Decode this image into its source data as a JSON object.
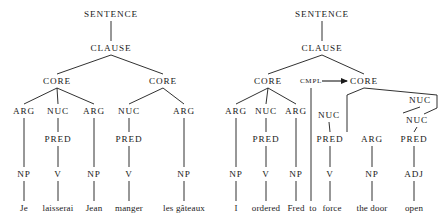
{
  "figure": {
    "type": "syntax-tree-pair"
  },
  "trees": [
    {
      "id": "left",
      "sentence": "Je laisserai Jean manger les gâteaux",
      "nodes": [
        {
          "id": "L-SENTENCE",
          "label": "SENTENCE",
          "x": 111,
          "y": 14,
          "cls": "lvl-sentence"
        },
        {
          "id": "L-CLAUSE",
          "label": "CLAUSE",
          "x": 111,
          "y": 48,
          "cls": "lvl-clause"
        },
        {
          "id": "L-CORE1",
          "label": "CORE",
          "x": 57,
          "y": 81,
          "cls": "lvl-core"
        },
        {
          "id": "L-CORE2",
          "label": "CORE",
          "x": 163,
          "y": 81,
          "cls": "lvl-core"
        },
        {
          "id": "L-ARG1",
          "label": "ARG",
          "x": 24,
          "y": 111,
          "cls": "lvl-arg"
        },
        {
          "id": "L-NUC1",
          "label": "NUC",
          "x": 58,
          "y": 111,
          "cls": "lvl-arg"
        },
        {
          "id": "L-ARG2",
          "label": "ARG",
          "x": 94,
          "y": 111,
          "cls": "lvl-arg"
        },
        {
          "id": "L-NUC2",
          "label": "NUC",
          "x": 129,
          "y": 111,
          "cls": "lvl-arg"
        },
        {
          "id": "L-ARG3",
          "label": "ARG",
          "x": 184,
          "y": 111,
          "cls": "lvl-arg"
        },
        {
          "id": "L-PRED1",
          "label": "PRED",
          "x": 58,
          "y": 139,
          "cls": "lvl-pred"
        },
        {
          "id": "L-PRED2",
          "label": "PRED",
          "x": 129,
          "y": 139,
          "cls": "lvl-pred"
        },
        {
          "id": "L-NP1",
          "label": "NP",
          "x": 24,
          "y": 174,
          "cls": "lvl-cat"
        },
        {
          "id": "L-V1",
          "label": "V",
          "x": 58,
          "y": 174,
          "cls": "lvl-cat"
        },
        {
          "id": "L-NP2",
          "label": "NP",
          "x": 94,
          "y": 174,
          "cls": "lvl-cat"
        },
        {
          "id": "L-V2",
          "label": "V",
          "x": 129,
          "y": 174,
          "cls": "lvl-cat"
        },
        {
          "id": "L-NP3",
          "label": "NP",
          "x": 184,
          "y": 174,
          "cls": "lvl-cat"
        }
      ],
      "words": [
        {
          "id": "L-W1",
          "text": "Je",
          "x": 24,
          "y": 208
        },
        {
          "id": "L-W2",
          "text": "laisserai",
          "x": 58,
          "y": 208
        },
        {
          "id": "L-W3",
          "text": "Jean",
          "x": 94,
          "y": 208
        },
        {
          "id": "L-W4",
          "text": "manger",
          "x": 129,
          "y": 208
        },
        {
          "id": "L-W5",
          "text": "les gâteaux",
          "x": 184,
          "y": 208
        }
      ],
      "edges": [
        [
          111,
          21,
          111,
          41
        ],
        [
          111,
          55,
          57,
          74
        ],
        [
          111,
          55,
          163,
          74
        ],
        [
          57,
          88,
          24,
          104
        ],
        [
          57,
          88,
          58,
          104
        ],
        [
          57,
          88,
          94,
          104
        ],
        [
          163,
          88,
          129,
          104
        ],
        [
          163,
          88,
          184,
          104
        ],
        [
          24,
          118,
          24,
          167
        ],
        [
          58,
          118,
          58,
          132
        ],
        [
          58,
          146,
          58,
          167
        ],
        [
          94,
          118,
          94,
          167
        ],
        [
          129,
          118,
          129,
          132
        ],
        [
          129,
          146,
          129,
          167
        ],
        [
          184,
          118,
          184,
          167
        ],
        [
          24,
          181,
          24,
          201
        ],
        [
          58,
          181,
          58,
          201
        ],
        [
          94,
          181,
          94,
          201
        ],
        [
          129,
          181,
          129,
          201
        ],
        [
          184,
          181,
          184,
          201
        ]
      ]
    },
    {
      "id": "right",
      "sentence": "I ordered Fred to force the door open",
      "nodes": [
        {
          "id": "R-SENTENCE",
          "label": "SENTENCE",
          "x": 322,
          "y": 14,
          "cls": "lvl-sentence"
        },
        {
          "id": "R-CLAUSE",
          "label": "CLAUSE",
          "x": 322,
          "y": 48,
          "cls": "lvl-clause"
        },
        {
          "id": "R-CORE1",
          "label": "CORE",
          "x": 268,
          "y": 81,
          "cls": "lvl-core"
        },
        {
          "id": "R-CMPL",
          "label": "CMPL",
          "x": 311,
          "y": 81,
          "cls": "lvl-cmpl"
        },
        {
          "id": "R-CORE2",
          "label": "CORE",
          "x": 364,
          "y": 81,
          "cls": "lvl-core"
        },
        {
          "id": "R-ARG1",
          "label": "ARG",
          "x": 236,
          "y": 111,
          "cls": "lvl-arg"
        },
        {
          "id": "R-NUC1",
          "label": "NUC",
          "x": 266,
          "y": 111,
          "cls": "lvl-arg"
        },
        {
          "id": "R-ARG2",
          "label": "ARG",
          "x": 296,
          "y": 111,
          "cls": "lvl-arg"
        },
        {
          "id": "R-NUC-UP",
          "label": "NUC",
          "x": 420,
          "y": 100,
          "cls": "lvl-arg"
        },
        {
          "id": "R-NUC2",
          "label": "NUC",
          "x": 329,
          "y": 115,
          "cls": "lvl-arg"
        },
        {
          "id": "R-NUC3",
          "label": "NUC",
          "x": 417,
          "y": 120,
          "cls": "lvl-arg"
        },
        {
          "id": "R-PRED1",
          "label": "PRED",
          "x": 266,
          "y": 139,
          "cls": "lvl-pred"
        },
        {
          "id": "R-PRED2",
          "label": "PRED",
          "x": 330,
          "y": 139,
          "cls": "lvl-pred"
        },
        {
          "id": "R-ARG3",
          "label": "ARG",
          "x": 372,
          "y": 139,
          "cls": "lvl-pred"
        },
        {
          "id": "R-PRED3",
          "label": "PRED",
          "x": 414,
          "y": 139,
          "cls": "lvl-pred"
        },
        {
          "id": "R-NP1",
          "label": "NP",
          "x": 236,
          "y": 174,
          "cls": "lvl-cat"
        },
        {
          "id": "R-V1",
          "label": "V",
          "x": 266,
          "y": 174,
          "cls": "lvl-cat"
        },
        {
          "id": "R-NP2",
          "label": "NP",
          "x": 296,
          "y": 174,
          "cls": "lvl-cat"
        },
        {
          "id": "R-V2",
          "label": "V",
          "x": 330,
          "y": 174,
          "cls": "lvl-cat"
        },
        {
          "id": "R-NP3",
          "label": "NP",
          "x": 372,
          "y": 174,
          "cls": "lvl-cat"
        },
        {
          "id": "R-ADJ",
          "label": "ADJ",
          "x": 414,
          "y": 174,
          "cls": "lvl-cat"
        }
      ],
      "words": [
        {
          "id": "R-W1",
          "text": "I",
          "x": 236,
          "y": 208
        },
        {
          "id": "R-W2",
          "text": "ordered",
          "x": 266,
          "y": 208
        },
        {
          "id": "R-W3",
          "text": "Fred",
          "x": 296,
          "y": 208
        },
        {
          "id": "R-W4",
          "text": "to",
          "x": 313,
          "y": 208
        },
        {
          "id": "R-W5",
          "text": "force",
          "x": 332,
          "y": 208
        },
        {
          "id": "R-W6",
          "text": "the door",
          "x": 372,
          "y": 208
        },
        {
          "id": "R-W7",
          "text": "open",
          "x": 414,
          "y": 208
        }
      ],
      "edges": [
        [
          322,
          21,
          322,
          41
        ],
        [
          322,
          55,
          268,
          74
        ],
        [
          322,
          55,
          364,
          74
        ],
        [
          268,
          88,
          236,
          104
        ],
        [
          268,
          88,
          266,
          104
        ],
        [
          268,
          88,
          296,
          104
        ],
        [
          311,
          88,
          311,
          201
        ],
        [
          364,
          88,
          347,
          95
        ],
        [
          347,
          95,
          347,
          132
        ],
        [
          364,
          88,
          437,
          95
        ],
        [
          437,
          95,
          437,
          108
        ],
        [
          437,
          108,
          424,
          114
        ],
        [
          420,
          107,
          403,
          113
        ],
        [
          236,
          118,
          236,
          167
        ],
        [
          266,
          118,
          266,
          132
        ],
        [
          266,
          146,
          266,
          167
        ],
        [
          296,
          118,
          296,
          167
        ],
        [
          329,
          122,
          330,
          132
        ],
        [
          330,
          146,
          330,
          167
        ],
        [
          417,
          127,
          414,
          132
        ],
        [
          414,
          146,
          414,
          167
        ],
        [
          372,
          146,
          372,
          167
        ],
        [
          236,
          181,
          236,
          201
        ],
        [
          266,
          181,
          266,
          201
        ],
        [
          296,
          181,
          296,
          201
        ],
        [
          330,
          181,
          330,
          201
        ],
        [
          372,
          181,
          372,
          201
        ],
        [
          414,
          181,
          414,
          201
        ]
      ],
      "arrow": {
        "x1": 322,
        "y1": 81,
        "x2": 347,
        "y2": 81
      }
    }
  ]
}
